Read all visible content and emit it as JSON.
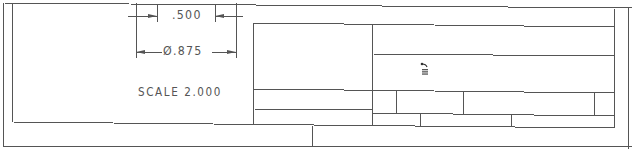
{
  "drawing": {
    "dimensions": {
      "width_value": ".500",
      "diameter_symbol": "Ø",
      "diameter_value": ".875",
      "diameter_label": "Ø.875"
    },
    "scale_label": "SCALE",
    "scale_value": "2.000",
    "scale_text": "SCALE  2.000"
  },
  "title_block": {
    "icon": "revision-arrow-icon",
    "cells": []
  },
  "colors": {
    "line": "#555555",
    "text": "#555555",
    "background": "#ffffff"
  }
}
